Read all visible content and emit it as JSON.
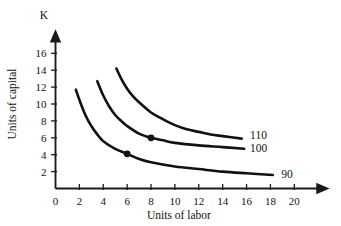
{
  "chart_data": {
    "type": "line",
    "title": "",
    "subtitle": "",
    "xlabel": "Units of labor",
    "ylabel": "Units of capital",
    "y_axis_symbol": "K",
    "xlim": [
      0,
      22
    ],
    "ylim": [
      0,
      17.5
    ],
    "x_ticks": [
      0,
      2,
      4,
      6,
      8,
      10,
      12,
      14,
      16,
      18,
      20
    ],
    "x_tick_labels": [
      "0",
      "2",
      "4",
      "6",
      "8",
      "10",
      "12",
      "14",
      "16",
      "18",
      "20"
    ],
    "y_ticks": [
      2,
      4,
      6,
      8,
      10,
      12,
      14,
      16
    ],
    "y_tick_labels": [
      "2",
      "4",
      "6",
      "8",
      "10",
      "12",
      "14",
      "16"
    ],
    "y_origin_label": "0",
    "grid": false,
    "legend": "inline-right-of-curve-end",
    "line_color": "#111111",
    "axis_color": "#1a1a1a",
    "background": "#ffffff",
    "series": [
      {
        "name": "90",
        "label": "90",
        "label_x": 18.9,
        "label_y": 1.75,
        "points": [
          {
            "x": 1.7,
            "y": 11.7
          },
          {
            "x": 2.0,
            "y": 10.5
          },
          {
            "x": 2.5,
            "y": 8.7
          },
          {
            "x": 3.0,
            "y": 7.4
          },
          {
            "x": 3.5,
            "y": 6.4
          },
          {
            "x": 4.0,
            "y": 5.6
          },
          {
            "x": 5.0,
            "y": 4.7
          },
          {
            "x": 6.0,
            "y": 4.1
          },
          {
            "x": 7.0,
            "y": 3.5
          },
          {
            "x": 8.0,
            "y": 3.1
          },
          {
            "x": 10.0,
            "y": 2.6
          },
          {
            "x": 12.0,
            "y": 2.3
          },
          {
            "x": 14.0,
            "y": 2.0
          },
          {
            "x": 16.0,
            "y": 1.8
          },
          {
            "x": 18.2,
            "y": 1.6
          }
        ]
      },
      {
        "name": "100",
        "label": "100",
        "label_x": 16.3,
        "label_y": 4.8,
        "points": [
          {
            "x": 3.5,
            "y": 12.7
          },
          {
            "x": 4.0,
            "y": 11.0
          },
          {
            "x": 4.5,
            "y": 9.7
          },
          {
            "x": 5.0,
            "y": 8.7
          },
          {
            "x": 5.5,
            "y": 8.0
          },
          {
            "x": 6.0,
            "y": 7.4
          },
          {
            "x": 7.0,
            "y": 6.5
          },
          {
            "x": 8.0,
            "y": 6.0
          },
          {
            "x": 9.0,
            "y": 5.7
          },
          {
            "x": 10.0,
            "y": 5.4
          },
          {
            "x": 12.0,
            "y": 5.1
          },
          {
            "x": 14.0,
            "y": 4.9
          },
          {
            "x": 15.8,
            "y": 4.7
          }
        ]
      },
      {
        "name": "110",
        "label": "110",
        "label_x": 16.3,
        "label_y": 6.3,
        "points": [
          {
            "x": 5.1,
            "y": 14.2
          },
          {
            "x": 5.5,
            "y": 13.0
          },
          {
            "x": 6.0,
            "y": 11.8
          },
          {
            "x": 6.5,
            "y": 10.9
          },
          {
            "x": 7.0,
            "y": 10.2
          },
          {
            "x": 8.0,
            "y": 9.0
          },
          {
            "x": 9.0,
            "y": 8.2
          },
          {
            "x": 10.0,
            "y": 7.5
          },
          {
            "x": 11.0,
            "y": 7.0
          },
          {
            "x": 12.0,
            "y": 6.7
          },
          {
            "x": 13.0,
            "y": 6.4
          },
          {
            "x": 14.0,
            "y": 6.2
          },
          {
            "x": 15.6,
            "y": 5.9
          }
        ]
      }
    ],
    "markers": [
      {
        "name": "point-on-100",
        "x": 8,
        "y": 6,
        "label": ""
      },
      {
        "name": "point-on-90",
        "x": 6,
        "y": 4.1,
        "label": ""
      }
    ]
  }
}
